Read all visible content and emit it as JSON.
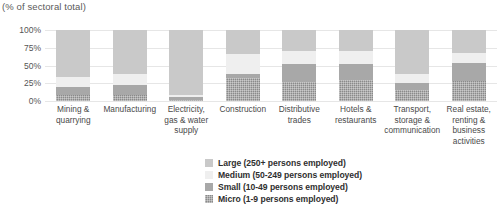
{
  "chart_data": {
    "type": "bar",
    "subtype": "stacked-bar-100-percent",
    "title": "",
    "subtitle": "(% of sectoral total)",
    "xlabel": "",
    "ylabel": "",
    "ylim": [
      0,
      100
    ],
    "y_ticks": [
      "0%",
      "25%",
      "50%",
      "75%",
      "100%"
    ],
    "y_tick_values": [
      0,
      25,
      50,
      75,
      100
    ],
    "grid": true,
    "legend_position": "bottom-center",
    "stack_order_bottom_to_top": [
      "Micro (1-9 persons employed)",
      "Small (10-49 persons employed)",
      "Medium (50-249 persons employed)",
      "Large (250+ persons employed)"
    ],
    "categories": [
      "Mining & quarrying",
      "Manufacturing",
      "Electricity, gas & water supply",
      "Construction",
      "Distributive trades",
      "Hotels & restaurants",
      "Transport, storage & communication",
      "Real estate, renting & business activities"
    ],
    "category_label_lines": [
      [
        "Mining &",
        "quarrying"
      ],
      [
        "Manufacturing"
      ],
      [
        "Electricity,",
        "gas & water",
        "supply"
      ],
      [
        "Construction"
      ],
      [
        "Distributive",
        "trades"
      ],
      [
        "Hotels &",
        "restaurants"
      ],
      [
        "Transport,",
        "storage &",
        "communication"
      ],
      [
        "Real estate,",
        "renting &",
        "business",
        "activities"
      ]
    ],
    "series": [
      {
        "name": "Micro (1-9 persons employed)",
        "key": "micro",
        "color": "#8a8a8a",
        "values": [
          9,
          9,
          2,
          33,
          27,
          30,
          15,
          28
        ]
      },
      {
        "name": "Small (10-49 persons employed)",
        "key": "small",
        "color": "#a8a8a8",
        "values": [
          11,
          13,
          3,
          5,
          25,
          22,
          10,
          25
        ]
      },
      {
        "name": "Medium (50-249 persons employed)",
        "key": "medium",
        "color": "#efefef",
        "values": [
          14,
          16,
          4,
          28,
          18,
          18,
          13,
          14
        ]
      },
      {
        "name": "Large (250+ persons employed)",
        "key": "large",
        "color": "#c9c9c9",
        "values": [
          66,
          62,
          91,
          34,
          30,
          30,
          62,
          33
        ]
      }
    ]
  },
  "legend": {
    "items": [
      {
        "label": "Large (250+ persons employed)",
        "color": "#c9c9c9"
      },
      {
        "label": "Medium (50-249 persons employed)",
        "color": "#efefef"
      },
      {
        "label": "Small (10-49 persons employed)",
        "color": "#a8a8a8"
      },
      {
        "label": "Micro (1-9 persons employed)",
        "color": "#8a8a8a"
      }
    ]
  },
  "colors": {
    "background": "#ffffff",
    "gridline": "#e6e6e6",
    "axis_text": "#555555",
    "label_text": "#4a4a4a",
    "legend_text": "#2f2f2f"
  }
}
